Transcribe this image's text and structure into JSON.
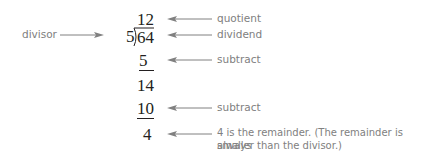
{
  "diagram": {
    "divisor_label": "divisor",
    "quotient": "12",
    "divisor": "5",
    "dividend": "64",
    "step1_subtract": "5",
    "step1_result": "14",
    "step2_subtract": "10",
    "remainder": "4",
    "labels": {
      "quotient": "quotient",
      "dividend": "dividend",
      "subtract1": "subtract",
      "subtract2": "subtract",
      "remainder_line1": "4 is the remainder. (The remainder is always",
      "remainder_line2": "smaller than the divisor.)"
    },
    "colors": {
      "numbers": "#231f20",
      "labels": "#808080",
      "arrows": "#808080"
    }
  }
}
